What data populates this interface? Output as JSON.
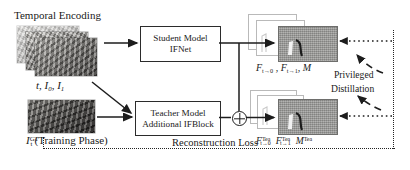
{
  "figure": {
    "type": "architecture-diagram",
    "caption_absent": true,
    "background_color": "#ffffff",
    "line_color": "#1d1d1d"
  },
  "labels": {
    "temporal_encoding": "Temporal Encoding",
    "inputs": "t, I0, I1",
    "inputs_parts": {
      "t": "t",
      "i0_base": "I",
      "i0_sub": "0",
      "i1_base": "I",
      "i1_sub": "1"
    },
    "gt_input": "ItGT (Training Phase)",
    "gt_parts": {
      "base": "I",
      "sup": "GT",
      "sub": "t",
      "paren": "(Training Phase)"
    },
    "student_outputs": "Ft→0 , Ft→1, M",
    "student_outputs_parts": {
      "f1_base": "F",
      "f1_sub": "t→0",
      "sep1": " , ",
      "f2_base": "F",
      "f2_sub": "t→1",
      "sep2": ", ",
      "m": "M"
    },
    "teacher_outputs": "FTeat→0 FTeat→1 MTea",
    "teacher_outputs_parts": {
      "f1_base": "F",
      "f1_sup": "Tea",
      "f1_sub": "t→0",
      "f2_base": "F",
      "f2_sup": "Tea",
      "f2_sub": "t→1",
      "m_base": "M",
      "m_sup": "Tea"
    },
    "privileged": "Privileged",
    "distillation": "Distillation",
    "reconstruction_loss": "Reconstruction Loss"
  },
  "boxes": [
    {
      "id": "student",
      "line1": "Student Model",
      "line2": "IFNet"
    },
    {
      "id": "teacher",
      "line1": "Teacher Model",
      "line2": "Additional IFBlock"
    }
  ],
  "operators": {
    "fusion": "plus-circle"
  },
  "flows": [
    {
      "from": "temporal-encoding-stack",
      "to": "student-model-box",
      "style": "solid-arrow"
    },
    {
      "from": "temporal-encoding-stack",
      "to": "teacher-model-box",
      "style": "solid-arrow-diagonal"
    },
    {
      "from": "gt-image",
      "to": "teacher-model-box",
      "style": "solid-arrow"
    },
    {
      "from": "student-model-box",
      "to": "student-output-stack",
      "style": "solid-arrow"
    },
    {
      "from": "student-model-box",
      "to": "fusion-operator",
      "style": "solid-branch"
    },
    {
      "from": "teacher-model-box",
      "to": "fusion-operator",
      "style": "solid-arrow"
    },
    {
      "from": "fusion-operator",
      "to": "teacher-output-stack",
      "style": "solid-arrow"
    },
    {
      "from": "teacher-output-stack",
      "to": "student-output-stack",
      "style": "dotted-arrow",
      "label": "Privileged Distillation"
    },
    {
      "from": "gt-image",
      "to": "reconstruction-loss-boundary",
      "style": "dotted"
    }
  ]
}
